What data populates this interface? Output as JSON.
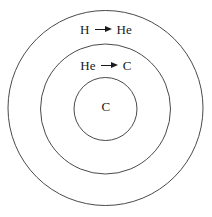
{
  "figure": {
    "background_color": "#ffffff",
    "stroke_color": "#4a4a4a",
    "text_color": "#1a1a1a",
    "width": 212,
    "height": 217
  },
  "shells": [
    {
      "name": "outer-shell",
      "center_x": 105.5,
      "center_y": 108,
      "radius": 97.5
    },
    {
      "name": "middle-shell",
      "center_x": 105.5,
      "center_y": 109,
      "radius": 65
    },
    {
      "name": "core",
      "center_x": 105.5,
      "center_y": 109,
      "radius": 31.5
    }
  ],
  "labels": {
    "outer_shell": {
      "reactant": "H",
      "arrow": "arrow-right-icon",
      "product": "He"
    },
    "middle_shell": {
      "reactant": "He",
      "arrow": "arrow-right-icon",
      "product": "C"
    },
    "core": {
      "species": "C"
    }
  }
}
